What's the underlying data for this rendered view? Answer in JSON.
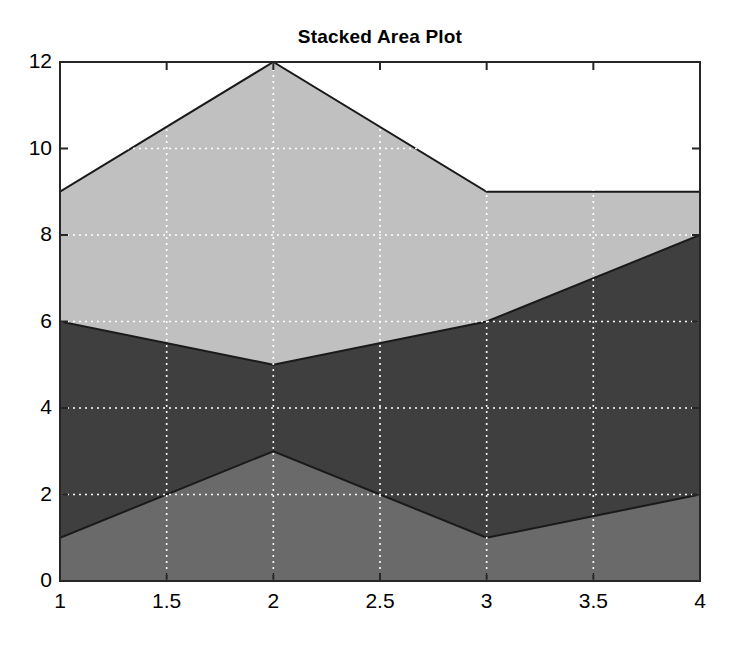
{
  "chart_data": {
    "type": "area",
    "stacked": true,
    "title": "Stacked Area Plot",
    "xlabel": "",
    "ylabel": "",
    "x": [
      1,
      2,
      3,
      4
    ],
    "xlim": [
      1,
      4
    ],
    "ylim": [
      0,
      12
    ],
    "xticks": [
      1,
      1.5,
      2,
      2.5,
      3,
      3.5,
      4
    ],
    "xtick_labels": [
      "1",
      "1.5",
      "2",
      "2.5",
      "3",
      "3.5",
      "4"
    ],
    "yticks": [
      0,
      2,
      4,
      6,
      8,
      10,
      12
    ],
    "ytick_labels": [
      "0",
      "2",
      "4",
      "6",
      "8",
      "10",
      "12"
    ],
    "grid": true,
    "grid_style": "dotted",
    "grid_color": "#ffffff",
    "legend": "none",
    "series": [
      {
        "name": "Series 1",
        "values": [
          1,
          3,
          1,
          2
        ],
        "cumulative": [
          1,
          3,
          1,
          2
        ],
        "color": "#6a6a6a",
        "edge_color": "#1a1a1a"
      },
      {
        "name": "Series 2",
        "values": [
          5,
          2,
          5,
          6
        ],
        "cumulative": [
          6,
          5,
          6,
          8
        ],
        "color": "#3f3f3f",
        "edge_color": "#1a1a1a"
      },
      {
        "name": "Series 3",
        "values": [
          3,
          7,
          3,
          1
        ],
        "cumulative": [
          9,
          12,
          9,
          9
        ],
        "color": "#c0c0c0",
        "edge_color": "#1a1a1a"
      }
    ]
  },
  "axes": {
    "background": "#ffffff",
    "border_color": "#262626"
  }
}
